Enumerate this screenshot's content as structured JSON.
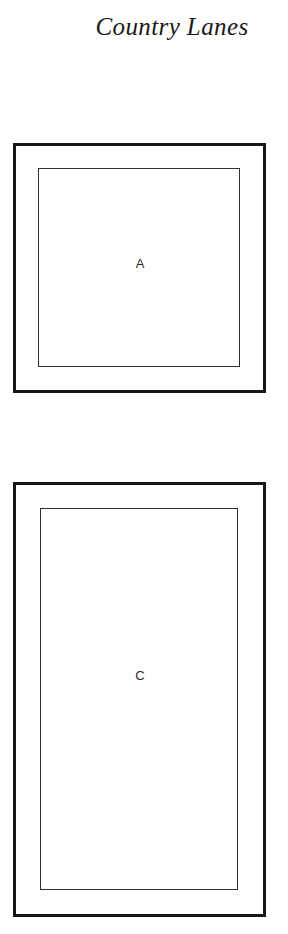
{
  "document": {
    "title": "Country Lanes",
    "background_color": "#ffffff",
    "ink_color": "#16161a"
  },
  "diagrams": [
    {
      "id": "a",
      "label": "A",
      "shape": "square",
      "outer_border_color": "#16161a",
      "inner_border_color": "#30303a"
    },
    {
      "id": "c",
      "label": "C",
      "shape": "rectangle-portrait",
      "outer_border_color": "#16161a",
      "inner_border_color": "#30303a"
    }
  ]
}
